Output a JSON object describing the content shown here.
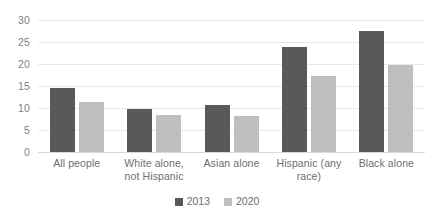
{
  "chart_data": {
    "type": "bar",
    "title": "",
    "subtitle": "",
    "xlabel": "",
    "ylabel": "",
    "ylim": [
      0,
      30
    ],
    "yticks": [
      0,
      5,
      10,
      15,
      20,
      25,
      30
    ],
    "grid": "horizontal",
    "legend_position": "bottom",
    "categories": [
      "All people",
      "White alone, not Hispanic",
      "Asian alone",
      "Hispanic (any race)",
      "Black alone"
    ],
    "series": [
      {
        "name": "2013",
        "color": "#595959",
        "values": [
          14.5,
          9.8,
          10.7,
          23.8,
          27.5
        ]
      },
      {
        "name": "2020",
        "color": "#bfbfbf",
        "values": [
          11.4,
          8.3,
          8.2,
          17.2,
          19.8
        ]
      }
    ]
  },
  "legend": {
    "items": [
      {
        "label": "2013",
        "color": "#595959"
      },
      {
        "label": "2020",
        "color": "#bfbfbf"
      }
    ]
  },
  "axis": {
    "y_tick_labels": [
      "30",
      "25",
      "20",
      "15",
      "10",
      "5",
      "0"
    ]
  },
  "colors": {
    "series_2013": "#595959",
    "series_2020": "#bfbfbf",
    "gridline": "#e8e8e8",
    "axis_text": "#7f7f7f",
    "background": "#ffffff"
  }
}
